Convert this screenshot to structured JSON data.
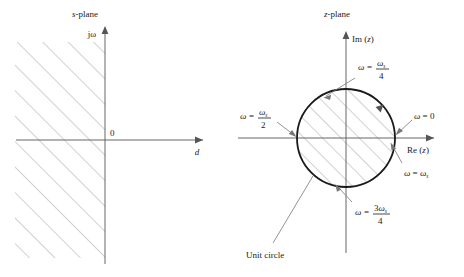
{
  "figure": {
    "title_left": "s-plane",
    "title_right": "z-plane"
  },
  "left_panel": {
    "name": "s-plane-diagram",
    "plane_label": "s-plane",
    "plane_label_italic": "s",
    "plane_label_rest": "-plane",
    "vertical_axis_label": "jω",
    "horizontal_axis_label": "d",
    "origin_label": "0",
    "region": "left half plane, hatched",
    "hatch_direction": "45-degree lines rising to the right"
  },
  "right_panel": {
    "name": "z-plane-diagram",
    "plane_label": "z-plane",
    "plane_label_italic": "z",
    "plane_label_rest": "-plane",
    "vertical_axis_label": "Im (z)",
    "vertical_axis_label_main": "Im (",
    "vertical_axis_label_italic": "z",
    "vertical_axis_label_close": ")",
    "horizontal_axis_label": "Re (z)",
    "horizontal_axis_label_main": "Re (",
    "horizontal_axis_label_italic": "z",
    "horizontal_axis_label_close": ")",
    "unit_circle_label": "Unit circle",
    "annotations": [
      {
        "id": "omega-zero",
        "text": "ω = 0",
        "omega": "ω",
        "equals": "=",
        "value": "0",
        "position": "right of circle, on positive real axis",
        "angle_deg": 0
      },
      {
        "id": "omega-s-over-4",
        "text": "ω = ωs/4",
        "omega": "ω",
        "equals": "=",
        "numerator": "ω",
        "numerator_sub": "s",
        "denominator": "4",
        "position": "upper right, points to top of circle",
        "angle_deg": 90
      },
      {
        "id": "omega-s-over-2",
        "text": "ω = ωs/2",
        "omega": "ω",
        "equals": "=",
        "numerator": "ω",
        "numerator_sub": "s",
        "denominator": "2",
        "position": "left of circle, on negative real axis",
        "angle_deg": 180
      },
      {
        "id": "omega-3-s-over-4",
        "text": "ω = 3ωs/4",
        "omega": "ω",
        "equals": "=",
        "numerator_coef": "3",
        "numerator": "ω",
        "numerator_sub": "s",
        "denominator": "4",
        "position": "lower right, points to bottom of circle",
        "angle_deg": 270
      },
      {
        "id": "omega-s",
        "text": "ω = ωs",
        "omega": "ω",
        "equals": "=",
        "value": "ω",
        "value_sub": "s",
        "position": "right of circle, below real axis",
        "angle_deg": 360
      }
    ]
  },
  "colors": {
    "axis": "#666666",
    "hatch": "#9a9a9a",
    "circle": "#1a1a1a",
    "text": "#1a1a1a",
    "leader": "#777777",
    "background": "#ffffff"
  }
}
